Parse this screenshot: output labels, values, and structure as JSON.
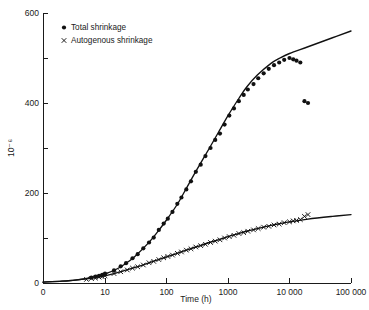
{
  "chart_data": {
    "type": "line",
    "title": "",
    "xlabel": "Time (h)",
    "ylabel": "10⁻⁶",
    "xscale": "log",
    "yscale": "linear",
    "xlim": [
      1,
      100000
    ],
    "ylim": [
      0,
      600
    ],
    "xticks": [
      0,
      10,
      100,
      1000,
      10000,
      100000
    ],
    "xticklabels": [
      "0",
      "10",
      "100",
      "1000",
      "10000",
      "100000"
    ],
    "yticks": [
      0,
      200,
      400,
      600
    ],
    "yticklabels": [
      "0",
      "200",
      "400",
      "600"
    ],
    "yminorticks": [
      100,
      300,
      500
    ],
    "grid": false,
    "legend_position": "top-left",
    "series": [
      {
        "name": "Total shrinkage",
        "marker": "filled-circle",
        "curve": [
          [
            1,
            2
          ],
          [
            2,
            4
          ],
          [
            3,
            6
          ],
          [
            5,
            10
          ],
          [
            7,
            14
          ],
          [
            10,
            20
          ],
          [
            15,
            30
          ],
          [
            20,
            40
          ],
          [
            30,
            58
          ],
          [
            50,
            88
          ],
          [
            70,
            112
          ],
          [
            100,
            140
          ],
          [
            150,
            175
          ],
          [
            200,
            205
          ],
          [
            300,
            248
          ],
          [
            500,
            300
          ],
          [
            700,
            335
          ],
          [
            1000,
            372
          ],
          [
            1500,
            410
          ],
          [
            2000,
            435
          ],
          [
            3000,
            462
          ],
          [
            5000,
            488
          ],
          [
            7000,
            500
          ],
          [
            10000,
            510
          ],
          [
            20000,
            525
          ],
          [
            50000,
            545
          ],
          [
            100000,
            560
          ]
        ],
        "points": [
          [
            6,
            12
          ],
          [
            7,
            14
          ],
          [
            8,
            16
          ],
          [
            9,
            18
          ],
          [
            10,
            21
          ],
          [
            14,
            28
          ],
          [
            18,
            37
          ],
          [
            22,
            44
          ],
          [
            28,
            55
          ],
          [
            34,
            64
          ],
          [
            42,
            77
          ],
          [
            52,
            90
          ],
          [
            62,
            101
          ],
          [
            75,
            118
          ],
          [
            90,
            132
          ],
          [
            105,
            143
          ],
          [
            125,
            158
          ],
          [
            150,
            176
          ],
          [
            175,
            190
          ],
          [
            210,
            208
          ],
          [
            250,
            226
          ],
          [
            300,
            247
          ],
          [
            360,
            263
          ],
          [
            430,
            282
          ],
          [
            520,
            300
          ],
          [
            620,
            318
          ],
          [
            740,
            332
          ],
          [
            880,
            352
          ],
          [
            1050,
            372
          ],
          [
            1250,
            388
          ],
          [
            1500,
            404
          ],
          [
            1800,
            418
          ],
          [
            2100,
            430
          ],
          [
            2600,
            442
          ],
          [
            3100,
            455
          ],
          [
            3800,
            466
          ],
          [
            4600,
            476
          ],
          [
            5600,
            484
          ],
          [
            6800,
            490
          ],
          [
            8200,
            496
          ],
          [
            10000,
            500
          ],
          [
            11500,
            497
          ],
          [
            13000,
            494
          ],
          [
            15000,
            490
          ],
          [
            17500,
            404
          ],
          [
            20000,
            400
          ]
        ]
      },
      {
        "name": "Autogenous shrinkage",
        "marker": "cross",
        "curve": [
          [
            1,
            2
          ],
          [
            2,
            4
          ],
          [
            3,
            6
          ],
          [
            5,
            9
          ],
          [
            7,
            12
          ],
          [
            10,
            16
          ],
          [
            15,
            22
          ],
          [
            20,
            27
          ],
          [
            30,
            34
          ],
          [
            50,
            44
          ],
          [
            70,
            51
          ],
          [
            100,
            58
          ],
          [
            150,
            66
          ],
          [
            200,
            72
          ],
          [
            300,
            80
          ],
          [
            500,
            90
          ],
          [
            700,
            96
          ],
          [
            1000,
            103
          ],
          [
            1500,
            110
          ],
          [
            2000,
            115
          ],
          [
            3000,
            121
          ],
          [
            5000,
            128
          ],
          [
            7000,
            132
          ],
          [
            10000,
            136
          ],
          [
            20000,
            142
          ],
          [
            50000,
            148
          ],
          [
            100000,
            152
          ]
        ],
        "points": [
          [
            5,
            8
          ],
          [
            6,
            10
          ],
          [
            7,
            11
          ],
          [
            8,
            13
          ],
          [
            9,
            14
          ],
          [
            10,
            16
          ],
          [
            14,
            21
          ],
          [
            18,
            25
          ],
          [
            23,
            29
          ],
          [
            28,
            33
          ],
          [
            34,
            36
          ],
          [
            42,
            40
          ],
          [
            52,
            45
          ],
          [
            62,
            48
          ],
          [
            75,
            52
          ],
          [
            90,
            56
          ],
          [
            105,
            59
          ],
          [
            125,
            62
          ],
          [
            150,
            66
          ],
          [
            175,
            69
          ],
          [
            210,
            73
          ],
          [
            250,
            76
          ],
          [
            300,
            80
          ],
          [
            360,
            83
          ],
          [
            430,
            86
          ],
          [
            520,
            90
          ],
          [
            620,
            93
          ],
          [
            740,
            96
          ],
          [
            880,
            100
          ],
          [
            1050,
            103
          ],
          [
            1250,
            106
          ],
          [
            1500,
            110
          ],
          [
            1800,
            112
          ],
          [
            2100,
            115
          ],
          [
            2600,
            118
          ],
          [
            3100,
            121
          ],
          [
            3800,
            124
          ],
          [
            4600,
            126
          ],
          [
            5600,
            129
          ],
          [
            6800,
            131
          ],
          [
            8200,
            134
          ],
          [
            10000,
            136
          ],
          [
            11500,
            138
          ],
          [
            13000,
            139
          ],
          [
            15000,
            141
          ],
          [
            17500,
            148
          ],
          [
            20000,
            152
          ]
        ]
      }
    ]
  },
  "legend": {
    "entries": [
      {
        "label": "Total shrinkage",
        "marker": "filled-circle"
      },
      {
        "label": "Autogenous shrinkage",
        "marker": "cross"
      }
    ]
  }
}
